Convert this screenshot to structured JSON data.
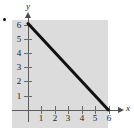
{
  "figure": {
    "bullet_marker": "•",
    "background_color": "#ffffff",
    "panel_color": "#dcdcdc",
    "line_color": "#111111",
    "axis_color": "#5a5a5a"
  },
  "axes": {
    "x_label": "x",
    "y_label": "y",
    "x_ticks": [
      "1",
      "2",
      "3",
      "4",
      "5",
      "6"
    ],
    "y_ticks": [
      "1",
      "2",
      "3",
      "4",
      "5",
      "6"
    ]
  },
  "chart_data": {
    "type": "line",
    "title": "",
    "subtitle": "",
    "xlabel": "x",
    "ylabel": "y",
    "xlim": [
      -0.6,
      7.2
    ],
    "ylim": [
      -0.6,
      7.0
    ],
    "xticks": [
      1,
      2,
      3,
      4,
      5,
      6
    ],
    "yticks": [
      1,
      2,
      3,
      4,
      5,
      6
    ],
    "xticklabels": [
      "1",
      "2",
      "3",
      "4",
      "5",
      "6"
    ],
    "yticklabels": [
      "1",
      "2",
      "3",
      "4",
      "5",
      "6"
    ],
    "grid": false,
    "legend": null,
    "legend_position": "none",
    "background": "#dcdcdc",
    "annotations": [],
    "series": [
      {
        "name": "x + y = 6",
        "type": "line",
        "color": "#111111",
        "linewidth": 3,
        "x": [
          0,
          6
        ],
        "y": [
          6,
          0
        ],
        "x_intercept": 6,
        "y_intercept": 6,
        "slope": -1
      }
    ]
  }
}
